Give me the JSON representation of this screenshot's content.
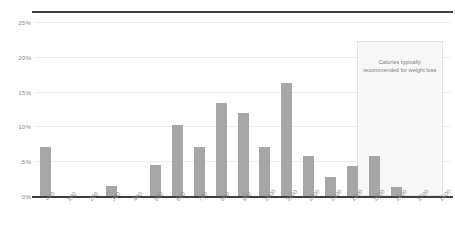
{
  "chart_data": {
    "type": "bar",
    "title": "",
    "subtitle": "",
    "xlabel": "",
    "ylabel": "",
    "categories": [
      "<=0",
      "100",
      "200",
      "300",
      "400",
      "500",
      "600",
      "700",
      "800",
      "900",
      "1000",
      "1100",
      "1200",
      "1300",
      "1400",
      "1500",
      "1600",
      "1700",
      "1800"
    ],
    "values": [
      7.1,
      0,
      0,
      1.4,
      0,
      4.4,
      10.2,
      7.1,
      13.3,
      11.9,
      7.1,
      16.3,
      5.8,
      2.7,
      4.3,
      5.8,
      1.3,
      0,
      0
    ],
    "ylim": [
      0,
      25
    ],
    "yticks": [
      0,
      5,
      10,
      15,
      20,
      25
    ],
    "ytick_labels": [
      "0%",
      "5%",
      "10%",
      "15%",
      "20%",
      "25%"
    ],
    "grid": true,
    "legend": false,
    "bar_color": "#a6a6a6",
    "annotations": [
      {
        "text": "Calories typically recommended for weight loss",
        "type": "shaded-band",
        "x_start": "1450",
        "x_end": "1800",
        "band_color": "#f7f7f7",
        "band_border": "#e4e4e4"
      }
    ]
  },
  "axis": {
    "y_ticks": [
      "0%",
      "5%",
      "10%",
      "15%",
      "20%",
      "25%"
    ],
    "x_ticks": [
      "<=0",
      "100",
      "200",
      "300",
      "400",
      "500",
      "600",
      "700",
      "800",
      "900",
      "1000",
      "1100",
      "1200",
      "1300",
      "1400",
      "1500",
      "1600",
      "1700",
      "1800"
    ]
  },
  "annotation": {
    "band_text": "Calories typically recommended for weight loss"
  }
}
